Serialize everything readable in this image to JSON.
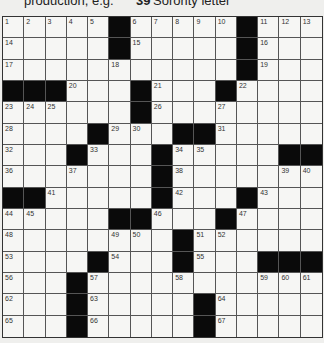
{
  "clue_strip": {
    "left_text": "production, e.g.",
    "right_number": "39",
    "right_text": "Sorority letter"
  },
  "grid": {
    "size": 15,
    "rows": [
      [
        "1",
        "2",
        "3",
        "4",
        "5",
        "#",
        "6",
        "7",
        "8",
        "9",
        "10",
        "#",
        "11",
        "12",
        "13"
      ],
      [
        "14",
        "",
        "",
        "",
        "",
        "#",
        "15",
        "",
        "",
        "",
        "",
        "#",
        "16",
        "",
        ""
      ],
      [
        "17",
        "",
        "",
        "",
        "",
        "18",
        "",
        "",
        "",
        "",
        "",
        "#",
        "19",
        "",
        ""
      ],
      [
        "#",
        "#",
        "#",
        "20",
        "",
        "",
        "#",
        "21",
        "",
        "",
        "#",
        "22",
        "",
        "",
        ""
      ],
      [
        "23",
        "24",
        "25",
        "",
        "",
        "",
        "#",
        "26",
        "",
        "",
        "27",
        "",
        "",
        "",
        ""
      ],
      [
        "28",
        "",
        "",
        "",
        "#",
        "29",
        "30",
        "",
        "#",
        "#",
        "31",
        "",
        "",
        "",
        ""
      ],
      [
        "32",
        "",
        "",
        "#",
        "33",
        "",
        "",
        "#",
        "34",
        "35",
        "",
        "",
        "",
        "#",
        "#"
      ],
      [
        "36",
        "",
        "",
        "37",
        "",
        "",
        "",
        "#",
        "38",
        "",
        "",
        "",
        "",
        "39",
        "40"
      ],
      [
        "#",
        "#",
        "41",
        "",
        "",
        "",
        "",
        "#",
        "42",
        "",
        "",
        "#",
        "43",
        "",
        ""
      ],
      [
        "44",
        "45",
        "",
        "",
        "",
        "#",
        "#",
        "46",
        "",
        "",
        "#",
        "47",
        "",
        "",
        ""
      ],
      [
        "48",
        "",
        "",
        "",
        "",
        "49",
        "50",
        "",
        "#",
        "51",
        "52",
        "",
        "",
        "",
        ""
      ],
      [
        "53",
        "",
        "",
        "",
        "#",
        "54",
        "",
        "",
        "#",
        "55",
        "",
        "",
        "#",
        "#",
        "#"
      ],
      [
        "56",
        "",
        "",
        "#",
        "57",
        "",
        "",
        "",
        "58",
        "",
        "",
        "",
        "59",
        "60",
        "61"
      ],
      [
        "62",
        "",
        "",
        "#",
        "63",
        "",
        "",
        "",
        "",
        "#",
        "64",
        "",
        "",
        "",
        ""
      ],
      [
        "65",
        "",
        "",
        "#",
        "66",
        "",
        "",
        "",
        "",
        "#",
        "67",
        "",
        "",
        "",
        ""
      ]
    ]
  }
}
